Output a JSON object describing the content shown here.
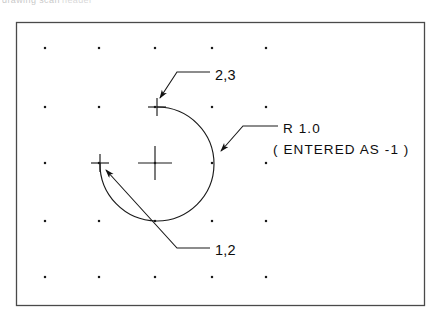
{
  "figure": {
    "caption_artifact_left": "drawing scan",
    "caption_artifact_right": "header",
    "border": {
      "x": 16,
      "y": 22,
      "width": 408,
      "height": 283,
      "color": "#4a4a4a"
    },
    "background": "#ffffff",
    "line_color": "#1a1a1a"
  },
  "grid": {
    "dot_color": "#1a1a1a",
    "columns_x": [
      45,
      99,
      155,
      212,
      266
    ],
    "rows_y": [
      48,
      107,
      163,
      221,
      277
    ],
    "dot_size": 2.2
  },
  "markers": {
    "arc_center": {
      "name": "center-cross",
      "x": 155,
      "y": 163,
      "arm": 17
    },
    "arc_start_point": {
      "name": "point-2-3-cross",
      "x": 157,
      "y": 107,
      "arm": 9
    },
    "arc_end_point": {
      "name": "point-1-2-cross",
      "x": 100,
      "y": 163,
      "arm": 9
    }
  },
  "arc": {
    "center_x": 155,
    "center_y": 163,
    "radius_px": 57,
    "radius_value": "1.0",
    "sweep": "major",
    "start_x": 157,
    "start_y": 107,
    "end_x": 100,
    "end_y": 163
  },
  "annotations": {
    "point_upper": {
      "label": "2,3",
      "text_x": 215,
      "text_y": 80,
      "leader": "M 210 72 L 177 72 L 160 98",
      "arrow_tip_x": 157,
      "arrow_tip_y": 104
    },
    "point_lower": {
      "label": "1,2",
      "text_x": 215,
      "text_y": 255,
      "leader": "M 210 248 L 177 248 L 106 170",
      "arrow_tip_x": 102,
      "arrow_tip_y": 166
    },
    "radius": {
      "line1": "R 1.0",
      "line2": "( ENTERED AS -1 )",
      "text_x": 283,
      "text_y1": 133,
      "text_y2": 154,
      "leader": "M 278 126 L 243 126 L 221 151",
      "arrow_tip_x": 215,
      "arrow_tip_y": 157
    }
  }
}
